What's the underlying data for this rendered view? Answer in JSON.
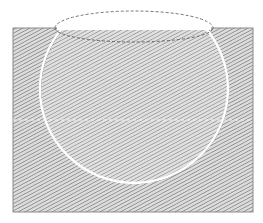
{
  "figure": {
    "background": "#ffffff",
    "rectangle": {
      "x": 13,
      "y": 28,
      "width": 240,
      "height": 184,
      "stroke": "#888888",
      "hatch_color": "#7a7a7a",
      "hatch_spacing": 3.2,
      "fill_bg": "#d8d8d8"
    },
    "circle": {
      "cx": 134,
      "cy": 89,
      "r": 94,
      "clip_top_y": 28,
      "outline": "#ffffff",
      "shadow": "#555555"
    },
    "ellipse": {
      "cx": 134,
      "cy": 27,
      "rx": 79,
      "ry": 17,
      "stroke": "#777777",
      "dash": "3,2"
    },
    "chord": {
      "y": 28,
      "x1": 57,
      "x2": 211,
      "color": "#ffffff"
    },
    "midline": {
      "y": 120,
      "x1": 13,
      "x2": 253,
      "color": "#eeeeee",
      "dash": "3,3"
    }
  }
}
